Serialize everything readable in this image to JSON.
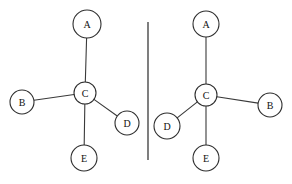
{
  "canvas": {
    "width": 292,
    "height": 184,
    "background": "#ffffff",
    "stroke_color": "#2e2e2e",
    "edge_color": "#3a3a3a",
    "label_color": "#111111"
  },
  "divider": {
    "name": "mirror-axis",
    "x": 148,
    "y1": 22,
    "y2": 160
  },
  "graphs": [
    {
      "id": "left-graph",
      "name": "original-graph",
      "nodes": [
        {
          "id": "A",
          "label": "A",
          "cx": 87,
          "cy": 24,
          "r": 14
        },
        {
          "id": "B",
          "label": "B",
          "cx": 22,
          "cy": 102,
          "r": 12
        },
        {
          "id": "C",
          "label": "C",
          "cx": 85,
          "cy": 93,
          "r": 11
        },
        {
          "id": "D",
          "label": "D",
          "cx": 127,
          "cy": 123,
          "r": 12
        },
        {
          "id": "E",
          "label": "E",
          "cx": 84,
          "cy": 158,
          "r": 13
        }
      ],
      "edges": [
        {
          "from": "C",
          "to": "A"
        },
        {
          "from": "C",
          "to": "B"
        },
        {
          "from": "C",
          "to": "D"
        },
        {
          "from": "C",
          "to": "E"
        }
      ]
    },
    {
      "id": "right-graph",
      "name": "mirrored-graph",
      "nodes": [
        {
          "id": "A",
          "label": "A",
          "cx": 206,
          "cy": 24,
          "r": 13
        },
        {
          "id": "B",
          "label": "B",
          "cx": 270,
          "cy": 105,
          "r": 12
        },
        {
          "id": "C",
          "label": "C",
          "cx": 206,
          "cy": 95,
          "r": 11
        },
        {
          "id": "D",
          "label": "D",
          "cx": 167,
          "cy": 126,
          "r": 13
        },
        {
          "id": "E",
          "label": "E",
          "cx": 206,
          "cy": 158,
          "r": 13
        }
      ],
      "edges": [
        {
          "from": "C",
          "to": "A"
        },
        {
          "from": "C",
          "to": "B"
        },
        {
          "from": "C",
          "to": "D"
        },
        {
          "from": "C",
          "to": "E"
        }
      ]
    }
  ]
}
